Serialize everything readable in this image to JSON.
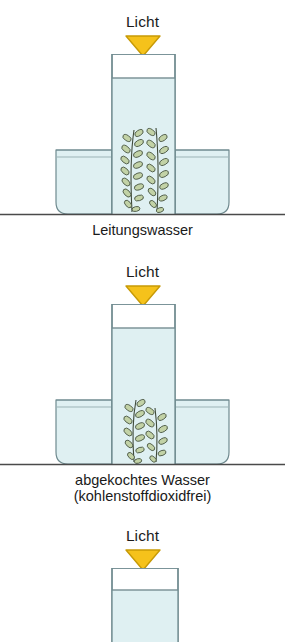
{
  "figure": {
    "background_color": "#ffffff",
    "baseline_color": "#4a4a4a",
    "glass_outline_color": "#6f8a8f",
    "water_fill_color": "#dff0f2",
    "air_fill_color": "#ffffff",
    "plant_stem_color": "#3f4a3a",
    "plant_leaf_color": "#b9cb9b",
    "light_arrow_fill": "#f5c21b",
    "light_arrow_stroke": "#c79a06",
    "text_color": "#1a1a1a"
  },
  "experiments": [
    {
      "id": "experiment-1",
      "light_label": "Licht",
      "light_arrow_icon": "down-triangle-icon",
      "caption_line_1": "Leitungswasser",
      "caption_line_2": "",
      "has_outer_dish": true,
      "has_plant": true,
      "plant_sprig_count": 2,
      "water_level_note": "Wasser bis knapp unter Rohrrand"
    },
    {
      "id": "experiment-2",
      "light_label": "Licht",
      "light_arrow_icon": "down-triangle-icon",
      "caption_line_1": "abgekochtes Wasser",
      "caption_line_2": "(kohlenstoffdioxidfrei)",
      "has_outer_dish": true,
      "has_plant": true,
      "plant_sprig_count": 2,
      "water_level_note": "Wasser bis knapp unter Rohrrand"
    },
    {
      "id": "experiment-3",
      "light_label": "Licht",
      "light_arrow_icon": "down-triangle-icon",
      "caption_line_1": "",
      "caption_line_2": "",
      "has_outer_dish": false,
      "has_plant": false,
      "plant_sprig_count": 0,
      "water_level_note": "nur Rohr sichtbar, unten abgeschnitten"
    }
  ]
}
